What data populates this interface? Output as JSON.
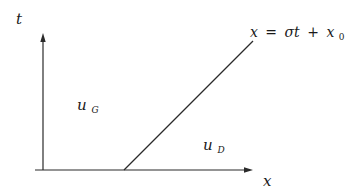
{
  "diagram": {
    "axes": {
      "t_label": "t",
      "x_label": "x"
    },
    "shock_line": {
      "equation_lhs": "x",
      "equation_eq": "=",
      "equation_sigma_t": "σt",
      "equation_plus": "+",
      "equation_x": "x",
      "equation_subscript": "0",
      "equation_text": "x = σt + x0"
    },
    "regions": {
      "left_state": {
        "base": "u",
        "subscript": "G"
      },
      "right_state": {
        "base": "u",
        "subscript": "D"
      }
    }
  }
}
